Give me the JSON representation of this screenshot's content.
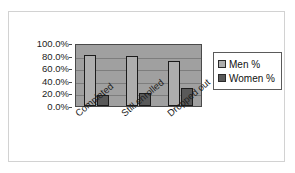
{
  "chart_data": {
    "type": "bar",
    "title": "",
    "subtitle": "",
    "xlabel": "",
    "ylabel": "",
    "categories": [
      "Completed",
      "Still enrolled",
      "Dropped out"
    ],
    "series": [
      {
        "name": "Men %",
        "color": "#aeaeae",
        "values": [
          81,
          80,
          71
        ]
      },
      {
        "name": "Women %",
        "color": "#595959",
        "values": [
          18,
          20,
          29
        ]
      }
    ],
    "ylim": [
      0,
      100
    ],
    "ytick_values": [
      100,
      80,
      60,
      40,
      20,
      0
    ],
    "ytick_labels": [
      "100.0%",
      "80.0%",
      "60.0%",
      "40.0%",
      "20.0%",
      "0.0%"
    ],
    "grid": true,
    "grid_axis": "y",
    "legend_position": "right",
    "legend_entries": [
      "Men %",
      "Women %"
    ],
    "plot_background": "#a0a0a0",
    "frame_background": "#ffffff",
    "xtick_rotation": -40
  }
}
